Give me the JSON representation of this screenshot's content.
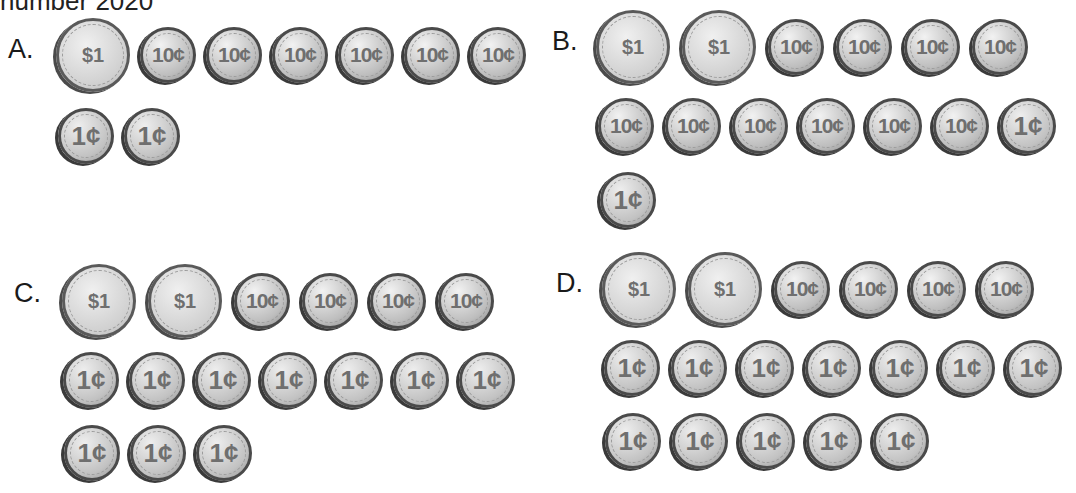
{
  "header": {
    "text": "number 2020"
  },
  "options": [
    {
      "label": "A.",
      "rows": [
        [
          "$1",
          "10¢",
          "10¢",
          "10¢",
          "10¢",
          "10¢",
          "10¢"
        ],
        [
          "1¢",
          "1¢"
        ]
      ]
    },
    {
      "label": "B.",
      "rows": [
        [
          "$1",
          "$1",
          "10¢",
          "10¢",
          "10¢",
          "10¢"
        ],
        [
          "10¢",
          "10¢",
          "10¢",
          "10¢",
          "10¢",
          "10¢",
          "1¢"
        ],
        [
          "1¢"
        ]
      ]
    },
    {
      "label": "C.",
      "rows": [
        [
          "$1",
          "$1",
          "10¢",
          "10¢",
          "10¢",
          "10¢"
        ],
        [
          "1¢",
          "1¢",
          "1¢",
          "1¢",
          "1¢",
          "1¢",
          "1¢"
        ],
        [
          "1¢",
          "1¢",
          "1¢"
        ]
      ]
    },
    {
      "label": "D.",
      "rows": [
        [
          "$1",
          "$1",
          "10¢",
          "10¢",
          "10¢",
          "10¢"
        ],
        [
          "1¢",
          "1¢",
          "1¢",
          "1¢",
          "1¢",
          "1¢",
          "1¢"
        ],
        [
          "1¢",
          "1¢",
          "1¢",
          "1¢",
          "1¢"
        ]
      ]
    }
  ]
}
